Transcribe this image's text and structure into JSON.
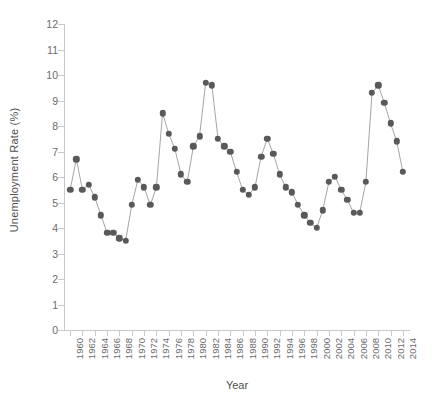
{
  "chart_data": {
    "type": "line",
    "title": "",
    "xlabel": "Year",
    "ylabel": "Unemployment Rate (%)",
    "xlim": [
      1959,
      2015
    ],
    "ylim": [
      0,
      12
    ],
    "grid": false,
    "legend": false,
    "marker": "circle",
    "series_color": "#595959",
    "line_color": "#9a9a9a",
    "axis_color": "#c9c9c9",
    "ytick_labels": [
      "0",
      "1",
      "2",
      "3",
      "4",
      "5",
      "6",
      "7",
      "8",
      "9",
      "10",
      "11",
      "12"
    ],
    "ytick_values": [
      0,
      1,
      2,
      3,
      4,
      5,
      6,
      7,
      8,
      9,
      10,
      11,
      12
    ],
    "xtick_labels": [
      "1960",
      "1962",
      "1964",
      "1966",
      "1968",
      "1970",
      "1972",
      "1974",
      "1976",
      "1978",
      "1980",
      "1982",
      "1984",
      "1986",
      "1988",
      "1990",
      "1992",
      "1994",
      "1996",
      "1998",
      "2000",
      "2002",
      "2004",
      "2006",
      "2008",
      "2010",
      "2012",
      "2014"
    ],
    "xtick_values": [
      1960,
      1962,
      1964,
      1966,
      1968,
      1970,
      1972,
      1974,
      1976,
      1978,
      1980,
      1982,
      1984,
      1986,
      1988,
      1990,
      1992,
      1994,
      1996,
      1998,
      2000,
      2002,
      2004,
      2006,
      2008,
      2010,
      2012,
      2014
    ],
    "x": [
      1960,
      1961,
      1962,
      1963,
      1964,
      1965,
      1966,
      1967,
      1968,
      1969,
      1970,
      1971,
      1972,
      1973,
      1974,
      1975,
      1976,
      1977,
      1978,
      1979,
      1980,
      1981,
      1982,
      1983,
      1984,
      1985,
      1986,
      1987,
      1988,
      1989,
      1990,
      1991,
      1992,
      1993,
      1994,
      1995,
      1996,
      1997,
      1998,
      1999,
      2000,
      2001,
      2002,
      2003,
      2004,
      2005,
      2006,
      2007,
      2008,
      2009,
      2010,
      2011,
      2012,
      2013,
      2014
    ],
    "values": [
      5.5,
      6.7,
      5.5,
      5.7,
      5.2,
      4.5,
      3.8,
      3.8,
      3.6,
      3.5,
      4.9,
      5.9,
      5.6,
      4.9,
      5.6,
      8.5,
      7.7,
      7.1,
      6.1,
      5.8,
      7.2,
      7.6,
      9.7,
      9.6,
      7.5,
      7.2,
      7.0,
      6.2,
      5.5,
      5.3,
      5.6,
      6.8,
      7.5,
      6.9,
      6.1,
      5.6,
      5.4,
      4.9,
      4.5,
      4.2,
      4.0,
      4.7,
      5.8,
      6.0,
      5.5,
      5.1,
      4.6,
      4.6,
      5.8,
      9.3,
      9.6,
      8.9,
      8.1,
      7.4,
      6.2
    ],
    "data_labels_shown": false
  }
}
